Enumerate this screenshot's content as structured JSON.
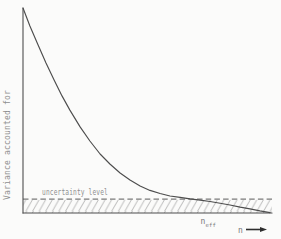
{
  "figure": {
    "y_axis_label": "Variance accounted for",
    "x_axis_label": "n",
    "uncertainty_label": "uncertainty level",
    "n_eff_base": "n",
    "n_eff_sub": "eff"
  },
  "colors": {
    "background": "#fbfbfa",
    "line": "#4d4d4d",
    "dashed": "#5a5a5a",
    "hatch": "#9b9b9b",
    "text_light": "#8f8f8f",
    "text_mid": "#7a7a7a",
    "arrow": "#2e2e2e"
  },
  "chart_data": {
    "type": "line",
    "title": "",
    "xlabel": "n",
    "ylabel": "Variance accounted for",
    "axes_numeric": false,
    "grid": false,
    "legend": "none",
    "annotations": [
      "uncertainty level",
      "n_eff"
    ],
    "uncertainty_level_fraction": 0.068,
    "n_eff_x_fraction": 0.75,
    "series": [
      {
        "name": "variance accounted for vs n",
        "points_normalized": [
          [
            0.0,
            1.0
          ],
          [
            0.028,
            0.912
          ],
          [
            0.061,
            0.82
          ],
          [
            0.093,
            0.732
          ],
          [
            0.126,
            0.649
          ],
          [
            0.158,
            0.571
          ],
          [
            0.19,
            0.502
          ],
          [
            0.231,
            0.42
          ],
          [
            0.271,
            0.351
          ],
          [
            0.312,
            0.288
          ],
          [
            0.352,
            0.239
          ],
          [
            0.393,
            0.195
          ],
          [
            0.433,
            0.161
          ],
          [
            0.474,
            0.132
          ],
          [
            0.514,
            0.11
          ],
          [
            0.555,
            0.095
          ],
          [
            0.595,
            0.083
          ],
          [
            0.636,
            0.076
          ],
          [
            0.676,
            0.069
          ],
          [
            0.717,
            0.063
          ],
          [
            0.757,
            0.056
          ],
          [
            0.798,
            0.048
          ],
          [
            0.838,
            0.039
          ],
          [
            0.879,
            0.029
          ],
          [
            0.919,
            0.02
          ],
          [
            0.959,
            0.01
          ],
          [
            1.0,
            0.002
          ]
        ]
      }
    ]
  }
}
